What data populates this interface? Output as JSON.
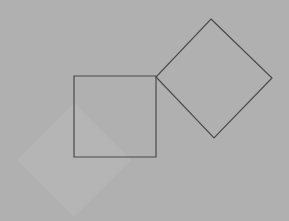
{
  "canvas": {
    "width": 289,
    "height": 221,
    "background_color": "#fafafa"
  },
  "figure": {
    "shapes": [
      {
        "name": "left-margin-band",
        "kind": "rectangle",
        "fill": "#b0b0b0",
        "stroke": "none",
        "x": 0,
        "y": 0,
        "width": 17,
        "height": 221
      },
      {
        "name": "shaded-diamond",
        "kind": "rotated-square",
        "fill": "#b5b5b5",
        "stroke": "none",
        "center_x": 74,
        "center_y": 160,
        "half_diagonal": 57,
        "rotation_deg": 45,
        "points": "74,103 131,160 74,217 17,160"
      },
      {
        "name": "axis-aligned-square",
        "kind": "square",
        "fill": "none",
        "stroke": "#4a4a4a",
        "stroke_width": 1.2,
        "x": 74,
        "y": 76,
        "width": 82,
        "height": 81,
        "points": "74,76 156,76 156,157 74,157"
      },
      {
        "name": "outlined-diamond",
        "kind": "rotated-square",
        "fill": "none",
        "stroke": "#4a4a4a",
        "stroke_width": 1.2,
        "center_x": 214,
        "center_y": 78,
        "rotation_deg": 45,
        "points": "211,19 272,78 214,138 156,77"
      }
    ]
  },
  "colors": {
    "outline": "#4a4a4a",
    "shade": "#b5b5b5",
    "band": "#b0b0b0",
    "background": "#fafafa"
  }
}
